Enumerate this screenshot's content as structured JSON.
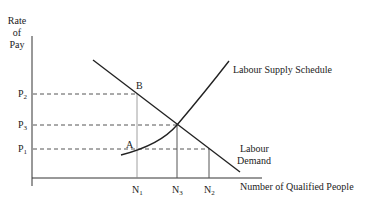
{
  "diagram": {
    "y_axis_label": [
      "Rate",
      "of",
      "Pay"
    ],
    "x_axis_label": "Number of Qualified People",
    "price_levels": [
      {
        "base": "P",
        "sub": "2"
      },
      {
        "base": "P",
        "sub": "3"
      },
      {
        "base": "P",
        "sub": "1"
      }
    ],
    "quantity_levels": [
      {
        "base": "N",
        "sub": "1"
      },
      {
        "base": "N",
        "sub": "3"
      },
      {
        "base": "N",
        "sub": "2"
      }
    ],
    "points": {
      "a": "A",
      "b": "B"
    },
    "curves": {
      "supply": "Labour Supply Schedule",
      "demand_line1": "Labour",
      "demand_line2": "Demand"
    },
    "colors": {
      "line": "#222222",
      "guide": "#555555"
    }
  }
}
